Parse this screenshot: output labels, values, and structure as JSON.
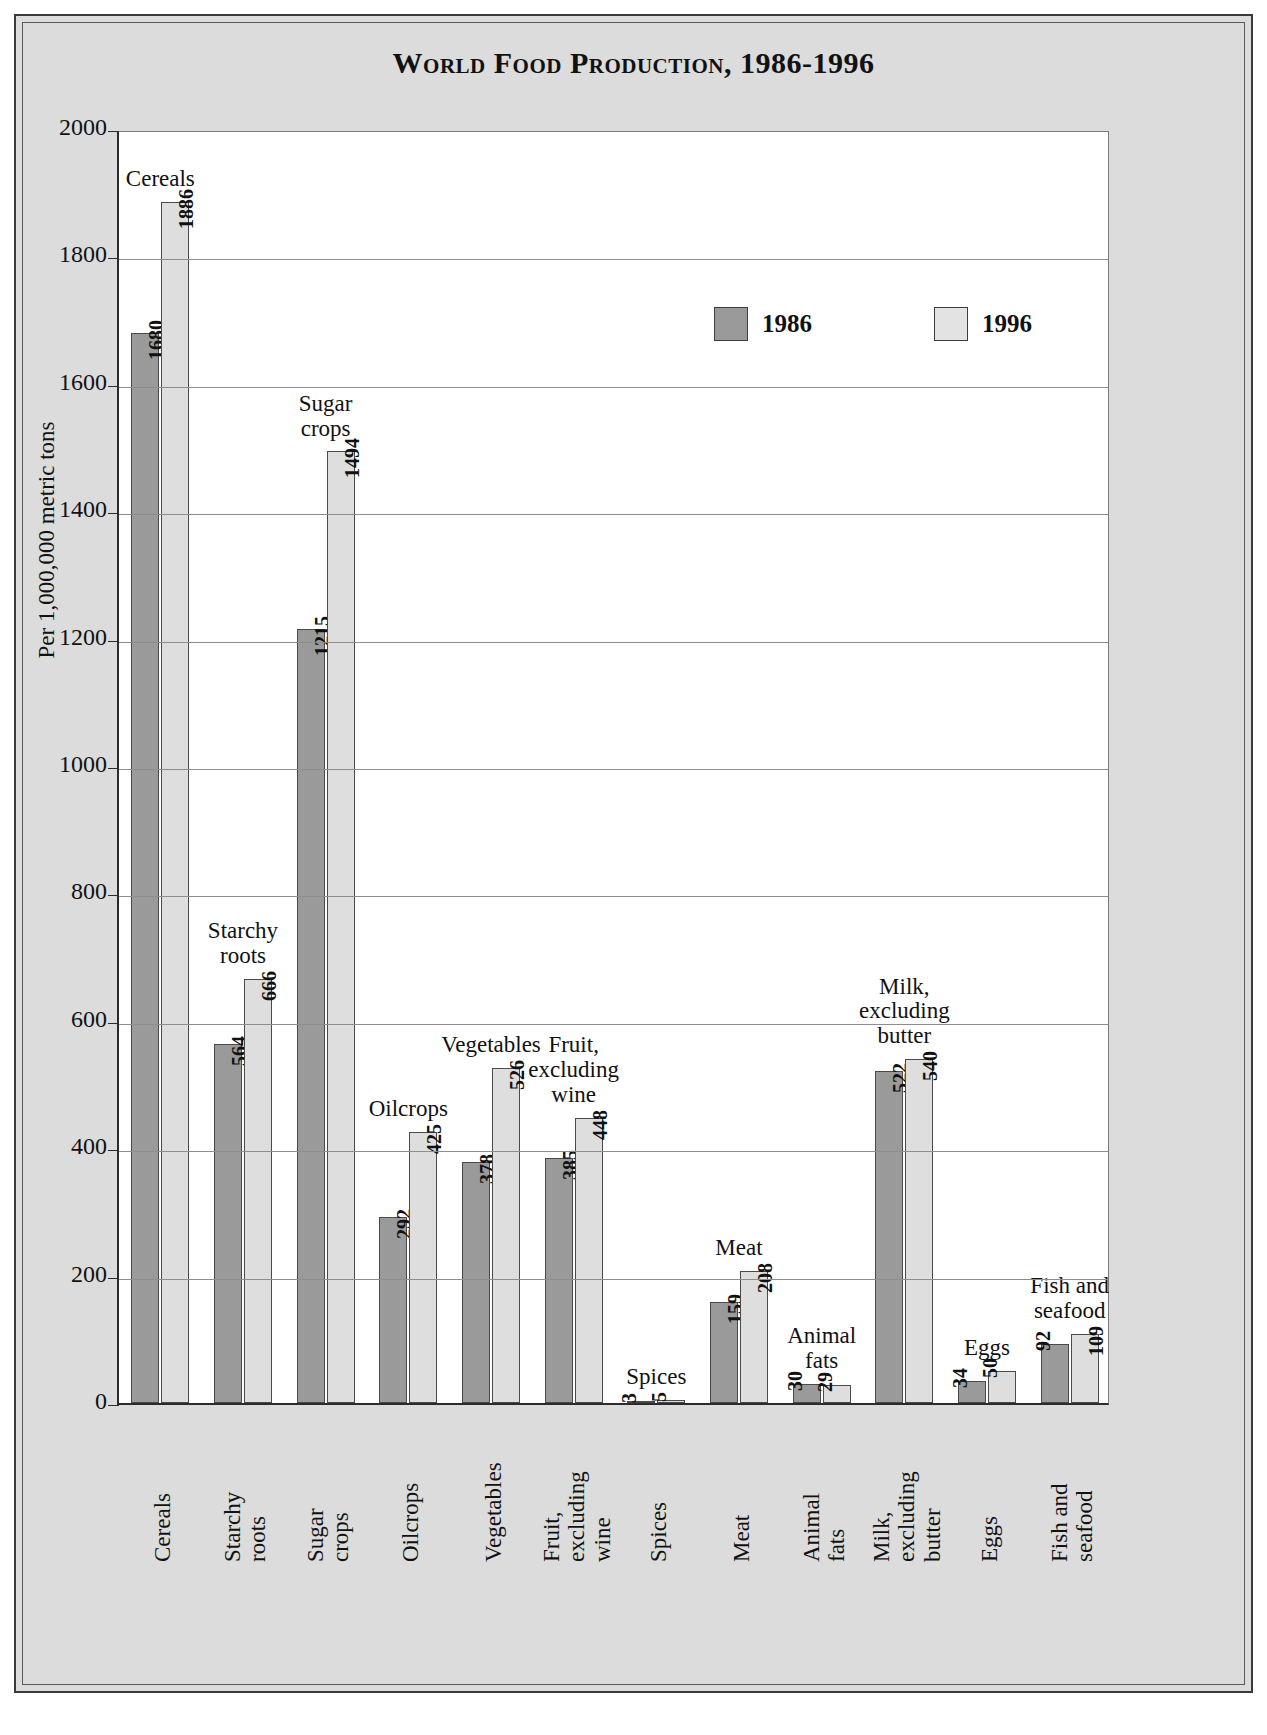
{
  "chart_data": {
    "type": "bar",
    "title": "World Food Production, 1986-1996",
    "xlabel": "",
    "ylabel": "Per 1,000,000 metric tons",
    "ylim": [
      0,
      2000
    ],
    "ytick_labels": [
      "2000",
      "1800",
      "1600",
      "1400",
      "1200",
      "1000",
      "800",
      "600",
      "400",
      "200",
      "0"
    ],
    "ytick_values": [
      2000,
      1800,
      1600,
      1400,
      1200,
      1000,
      800,
      600,
      400,
      200,
      0
    ],
    "grid": true,
    "legend_position": "upper-right-inside",
    "categories": [
      "Cereals",
      "Starchy roots",
      "Sugar crops",
      "Oilcrops",
      "Vegetables",
      "Fruit, excluding wine",
      "Spices",
      "Meat",
      "Animal fats",
      "Milk, excluding butter",
      "Eggs",
      "Fish and seafood"
    ],
    "category_labels_wrapped": [
      "Cereals",
      "Starchy\nroots",
      "Sugar\ncrops",
      "Oilcrops",
      "Vegetables",
      "Fruit,\nexcluding\nwine",
      "Spices",
      "Meat",
      "Animal\nfats",
      "Milk,\nexcluding\nbutter",
      "Eggs",
      "Fish and\nseafood"
    ],
    "axis_tick_labels_wrapped": [
      "Cereals",
      "Starchy\nroots",
      "Sugar\ncrops",
      "Oilcrops",
      "Vegetables",
      "Fruit,\nexcluding\nwine",
      "Spices",
      "Meat",
      "Animal\nfats",
      "Milk,\nexcluding\nbutter",
      "Eggs",
      "Fish and\nseafood"
    ],
    "series": [
      {
        "name": "1986",
        "color": "#9a9a9a",
        "values": [
          1680,
          564,
          1215,
          292,
          378,
          385,
          3,
          159,
          30,
          522,
          34,
          92
        ]
      },
      {
        "name": "1996",
        "color": "#dedede",
        "values": [
          1886,
          666,
          1494,
          425,
          526,
          448,
          5,
          208,
          29,
          540,
          50,
          109
        ]
      }
    ]
  },
  "legend": {
    "items": [
      {
        "label": "1986",
        "color": "#9a9a9a"
      },
      {
        "label": "1996",
        "color": "#e3e3e3"
      }
    ]
  },
  "colors": {
    "frame_background": "#dcdcdc",
    "plot_background": "#ffffff",
    "axis": "#2b2b2b",
    "gridline": "#8d8d8d",
    "bar_1986": "#9a9a9a",
    "bar_1996": "#dedede"
  },
  "source_note": ""
}
